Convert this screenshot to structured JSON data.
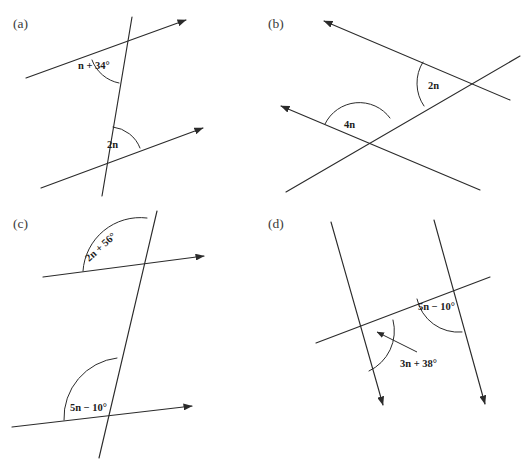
{
  "figure": {
    "background_color": "#ffffff",
    "line_color": "#2b2b2b",
    "text_color": "#1c1c1c",
    "width": 532,
    "height": 469
  },
  "panels": [
    {
      "id": "a",
      "label": "(a)",
      "description": "Two parallel lines cut by a steep transversal",
      "angles": [
        {
          "id": "a-upper",
          "label": "n + 34°"
        },
        {
          "id": "a-lower",
          "label": "2n"
        }
      ]
    },
    {
      "id": "b",
      "label": "(b)",
      "description": "Two parallel left-pointing rays cut by a rising transversal",
      "angles": [
        {
          "id": "b-upper",
          "label": "2n"
        },
        {
          "id": "b-lower",
          "label": "4n"
        }
      ]
    },
    {
      "id": "c",
      "label": "(c)",
      "description": "Two parallel right-pointing rays cut by a steep transversal",
      "angles": [
        {
          "id": "c-upper",
          "label": "2n + 56°"
        },
        {
          "id": "c-lower",
          "label": "5n − 10°"
        }
      ]
    },
    {
      "id": "d",
      "label": "(d)",
      "description": "Two parallel downward rays cut by a rising transversal",
      "angles": [
        {
          "id": "d-right",
          "label": "5n − 10°"
        },
        {
          "id": "d-left",
          "label": "3n + 38°"
        }
      ]
    }
  ]
}
